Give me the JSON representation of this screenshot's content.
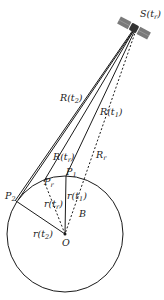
{
  "diagram": {
    "satellite_label": "S(t_r)",
    "labels": {
      "R_t2": "R(t2)",
      "R_t1": "R(t1)",
      "R_tr": "R(tr)",
      "R_r": "Rr",
      "r_t1": "r(t1)",
      "r_t2": "r(t2)",
      "r_tr": "r(tr)",
      "P1": "P1",
      "P2": "P2",
      "Pr": "Pr",
      "B": "B",
      "O": "O"
    },
    "points": {
      "S": [
        134,
        28
      ],
      "O": [
        65,
        234
      ],
      "P1": [
        66,
        176
      ],
      "P2": [
        16,
        201
      ],
      "Pr": [
        44,
        180
      ]
    },
    "circle": {
      "cx": 65,
      "cy": 234,
      "r": 58
    },
    "colors": {
      "line": "#1a1a1a",
      "satellite_panel": "#7a7a7a",
      "satellite_body": "#333333"
    }
  }
}
